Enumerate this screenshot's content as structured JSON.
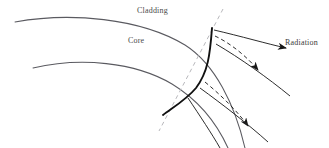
{
  "figure": {
    "width": 329,
    "height": 148,
    "background_color": "#ffffff"
  },
  "labels": {
    "cladding": "Cladding",
    "core": "Core",
    "radiation": "Radiation"
  },
  "colors": {
    "boundary_curve": "#5a5a60",
    "guided_ray": "#111111",
    "radiation_ray": "#222222",
    "dashed_normal": "#b8b8bc",
    "text": "#4a4a4a"
  },
  "geometry": {
    "cladding_boundary": "M 15 22 C 70 12, 140 18, 185 45 C 215 64, 235 105, 245 148",
    "core_boundary": "M 33 68 C 80 57, 135 62, 172 84 C 200 101, 218 126, 228 148",
    "guided_ray": "M 212 28 C 210 55, 208 72, 196 88 C 186 100, 172 108, 163 115",
    "normal_dashed": "M 223 9 L 159 131",
    "radiation_rays": [
      {
        "id": "ray-1",
        "style": "solid",
        "path": "M 214 30 C 240 36, 268 44, 286 48",
        "arrow_at": [
          284,
          47
        ],
        "arrow_angle": 14
      },
      {
        "id": "ray-2",
        "style": "dashed",
        "path": "M 215 36 C 232 44, 248 58, 258 70",
        "arrow_at": [
          256,
          68
        ],
        "arrow_angle": 50
      },
      {
        "id": "ray-3",
        "style": "solid",
        "path": "M 216 44 C 240 58, 268 78, 290 96",
        "arrow_at": [
          288,
          95
        ],
        "arrow_angle": 40
      },
      {
        "id": "ray-4",
        "style": "dashed",
        "path": "M 205 82 C 222 96, 238 112, 248 126",
        "arrow_at": [
          246,
          124
        ],
        "arrow_angle": 55
      },
      {
        "id": "ray-5",
        "style": "solid",
        "path": "M 200 88 C 222 104, 248 124, 268 142",
        "arrow_at": [
          266,
          141
        ],
        "arrow_angle": 42
      },
      {
        "id": "ray-6",
        "style": "solid",
        "path": "M 188 98 C 200 116, 212 134, 220 148",
        "arrow_at": null,
        "arrow_angle": 0
      }
    ]
  }
}
